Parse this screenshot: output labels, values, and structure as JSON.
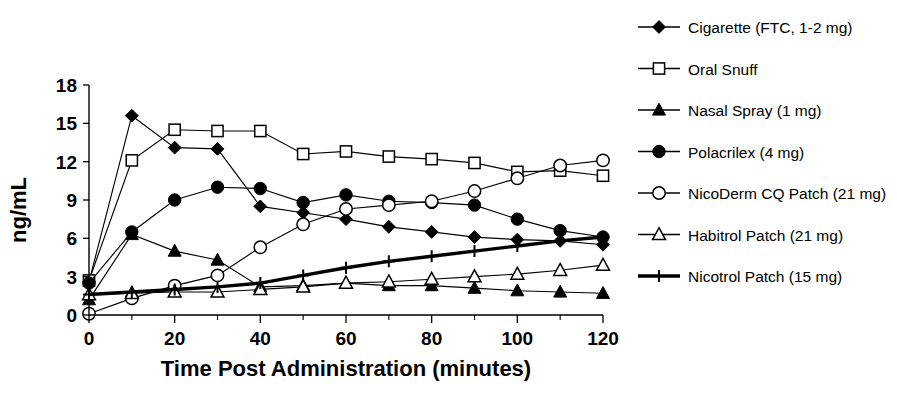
{
  "chart_data": {
    "type": "line",
    "title": "",
    "xlabel": "Time Post Administration (minutes)",
    "ylabel": "ng/mL",
    "xlim": [
      0,
      120
    ],
    "ylim": [
      0,
      18
    ],
    "xticks": [
      0,
      20,
      40,
      60,
      80,
      100,
      120
    ],
    "xtick_labels": [
      "0",
      "20",
      "40",
      "60",
      "80",
      "100",
      "120"
    ],
    "xminor_ticks": [
      10,
      30,
      50,
      70,
      90,
      110
    ],
    "yticks": [
      0,
      3,
      6,
      9,
      12,
      15,
      18
    ],
    "ytick_labels": [
      "0",
      "3",
      "6",
      "9",
      "12",
      "15",
      "18"
    ],
    "grid": false,
    "legend_position": "right",
    "x": [
      0,
      10,
      20,
      30,
      40,
      50,
      60,
      70,
      80,
      90,
      100,
      110,
      120
    ],
    "series": [
      {
        "name": "Cigarette (FTC, 1-2 mg)",
        "label": "Cigarette (FTC, 1-2 mg)",
        "marker": "filled-diamond",
        "line": "thin",
        "values": [
          2.6,
          15.6,
          13.1,
          13.0,
          8.5,
          8.0,
          7.5,
          6.9,
          6.5,
          6.1,
          5.9,
          5.8,
          5.5
        ]
      },
      {
        "name": "Oral Snuff",
        "label": "Oral Snuff",
        "marker": "open-square",
        "line": "thin",
        "values": [
          2.7,
          12.1,
          14.5,
          14.4,
          14.4,
          12.6,
          12.8,
          12.4,
          12.2,
          11.9,
          11.2,
          11.3,
          10.9
        ]
      },
      {
        "name": "Nasal Spray (1 mg)",
        "label": "Nasal Spray (1 mg)",
        "marker": "filled-triangle",
        "line": "thin",
        "values": [
          1.2,
          6.3,
          5.0,
          4.3,
          2.2,
          2.3,
          2.5,
          2.3,
          2.3,
          2.1,
          1.9,
          1.8,
          1.7
        ]
      },
      {
        "name": "Polacrilex (4 mg)",
        "label": "Polacrilex (4 mg)",
        "marker": "filled-circle",
        "line": "thin",
        "values": [
          2.5,
          6.5,
          9.0,
          10.0,
          9.9,
          8.8,
          9.4,
          8.9,
          8.8,
          8.6,
          7.5,
          6.6,
          6.1
        ]
      },
      {
        "name": "NicoDerm CQ Patch (21 mg)",
        "label": "NicoDerm CQ Patch (21 mg)",
        "marker": "open-circle",
        "line": "thin",
        "values": [
          0.1,
          1.3,
          2.3,
          3.1,
          5.3,
          7.1,
          8.3,
          8.6,
          8.9,
          9.7,
          10.7,
          11.7,
          12.1
        ]
      },
      {
        "name": "Habitrol Patch (21 mg)",
        "label": "Habitrol Patch (21 mg)",
        "marker": "open-triangle",
        "line": "thin",
        "values": [
          1.6,
          1.7,
          1.8,
          1.8,
          2.0,
          2.2,
          2.5,
          2.6,
          2.8,
          3.0,
          3.2,
          3.5,
          3.9
        ]
      },
      {
        "name": "Nicotrol Patch (15 mg)",
        "label": "Nicotrol Patch (15 mg)",
        "marker": "plus",
        "line": "thick",
        "values": [
          1.6,
          1.8,
          2.0,
          2.2,
          2.5,
          3.1,
          3.7,
          4.2,
          4.6,
          5.0,
          5.4,
          5.8,
          6.1
        ]
      }
    ]
  },
  "colors": {
    "foreground": "#000000",
    "background": "#ffffff"
  }
}
